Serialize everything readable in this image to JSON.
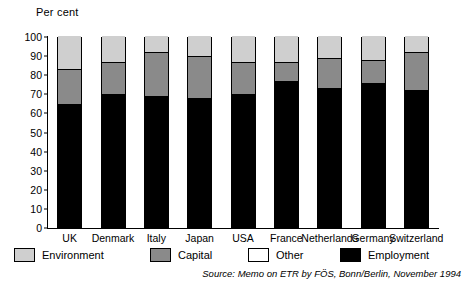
{
  "chart_data": {
    "type": "bar",
    "subtype": "stacked-bar-100",
    "title": "",
    "ylabel": "Per cent",
    "xlabel": "",
    "ylim": [
      0,
      100
    ],
    "yticks": [
      0,
      10,
      20,
      30,
      40,
      50,
      60,
      70,
      80,
      90,
      100
    ],
    "grid": false,
    "legend_position": "bottom",
    "categories": [
      "UK",
      "Denmark",
      "Italy",
      "Japan",
      "USA",
      "France",
      "Netherlands",
      "Germany",
      "Switzerland"
    ],
    "series": [
      {
        "name": "Employment",
        "color": "#000000",
        "values": [
          64,
          69,
          68,
          67,
          69,
          76,
          72,
          75,
          71
        ]
      },
      {
        "name": "Capital",
        "color": "#8a8a8a",
        "values": [
          18,
          17,
          23,
          22,
          17,
          10,
          16,
          12,
          20
        ]
      },
      {
        "name": "Other",
        "color": "#ffffff",
        "values": [
          0,
          0,
          0,
          0,
          0,
          0,
          0,
          0,
          0
        ]
      },
      {
        "name": "Environment",
        "color": "#cfcfcf",
        "values": [
          18,
          14,
          9,
          11,
          14,
          14,
          12,
          13,
          9
        ]
      }
    ],
    "stack_tops": {
      "Employment": [
        64,
        69,
        68,
        67,
        69,
        76,
        72,
        75,
        71
      ],
      "Capital": [
        82,
        86,
        91,
        89,
        86,
        86,
        88,
        87,
        91
      ],
      "Environment": [
        100,
        100,
        100,
        100,
        100,
        100,
        100,
        100,
        100
      ]
    },
    "annotations": []
  },
  "legend": {
    "items": [
      {
        "label": "Environment",
        "color": "#cfcfcf"
      },
      {
        "label": "Capital",
        "color": "#8a8a8a"
      },
      {
        "label": "Other",
        "color": "#ffffff"
      },
      {
        "label": "Employment",
        "color": "#000000"
      }
    ]
  },
  "source": {
    "prefix": "Source:",
    "text": "Memo on ETR by FÖS, Bonn/Berlin, November 1994",
    "full": "Source: Memo on ETR by FÖS, Bonn/Berlin, November 1994"
  }
}
